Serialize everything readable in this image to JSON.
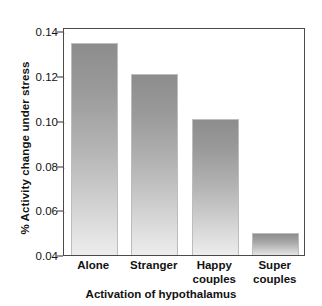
{
  "chart_data": {
    "type": "bar",
    "title": "",
    "xlabel": "Activation of hypothalamus",
    "ylabel": "% Activity change under stress",
    "categories": [
      "Alone",
      "Stranger",
      "Happy couples",
      "Super couples"
    ],
    "category_lines": [
      [
        "Alone"
      ],
      [
        "Stranger"
      ],
      [
        "Happy",
        "couples"
      ],
      [
        "Super",
        "couples"
      ]
    ],
    "values": [
      0.135,
      0.121,
      0.101,
      0.05
    ],
    "ylim": [
      0.04,
      0.142
    ],
    "yticks": [
      0.04,
      0.06,
      0.08,
      0.1,
      0.12,
      0.14
    ],
    "ytick_labels": [
      "0.04",
      "0.06",
      "0.08",
      "0.10",
      "0.12",
      "0.14"
    ],
    "grid": true,
    "grid_axis": "y",
    "legend": false,
    "bar_color_top": "#8d8d8d",
    "bar_color_bottom": "#ededed",
    "axis_color": "#4a4a4a",
    "text_color": "#121212"
  }
}
